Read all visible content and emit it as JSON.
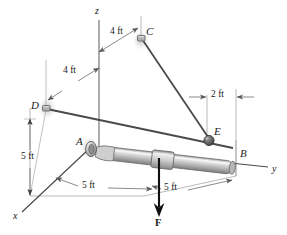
{
  "figure": {
    "kind": "engineering-statics-free-body-diagram",
    "colors": {
      "line": "#3a3a3a",
      "thin_line": "#8a8a8a",
      "rod_light": "#e4e4e4",
      "rod_mid": "#b9b9b9",
      "rod_dark": "#8f8f8f",
      "support": "#9a9a9a",
      "shadow": "#c9c9c9",
      "force": "#111111",
      "text": "#1a1a1a"
    }
  },
  "axes": [
    {
      "id": "axis-z",
      "label": "z"
    },
    {
      "id": "axis-y",
      "label": "y"
    },
    {
      "id": "axis-x",
      "label": "x"
    }
  ],
  "points": [
    {
      "id": "point-a",
      "label": "A"
    },
    {
      "id": "point-b",
      "label": "B"
    },
    {
      "id": "point-c",
      "label": "C"
    },
    {
      "id": "point-d",
      "label": "D"
    },
    {
      "id": "point-e",
      "label": "E"
    }
  ],
  "dimensions": [
    {
      "id": "dim-c-upper",
      "label": "4 ft"
    },
    {
      "id": "dim-d-upper",
      "label": "4 ft"
    },
    {
      "id": "dim-d-height",
      "label": "5 ft"
    },
    {
      "id": "dim-a-to-collar",
      "label": "5 ft"
    },
    {
      "id": "dim-collar-to-b",
      "label": "5 ft"
    },
    {
      "id": "dim-e-offset",
      "label": "2 ft"
    }
  ],
  "force": {
    "id": "force-f",
    "label": "F",
    "direction": "downward"
  }
}
